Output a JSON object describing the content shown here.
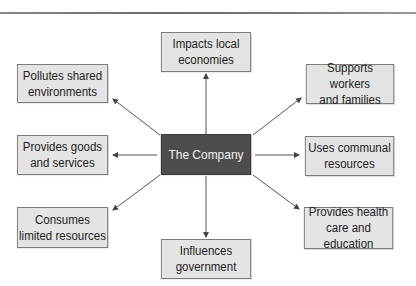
{
  "diagram": {
    "type": "hub-and-spoke",
    "center": {
      "label": "The Company",
      "fill": "#4d4d4d",
      "text_color": "#f2f2f2"
    },
    "node_fill": "#e4e4e4",
    "node_border": "#7a7a7a",
    "edge_color": "#555555",
    "nodes": [
      {
        "id": "top",
        "label": "Impacts local\neconomies"
      },
      {
        "id": "top-left",
        "label": "Pollutes shared\nenvironments"
      },
      {
        "id": "top-right",
        "label": "Supports workers\nand families"
      },
      {
        "id": "left",
        "label": "Provides goods\nand services"
      },
      {
        "id": "right",
        "label": "Uses communal\nresources"
      },
      {
        "id": "bottom-left",
        "label": "Consumes\nlimited resources"
      },
      {
        "id": "bottom-right",
        "label": "Provides health\ncare and education"
      },
      {
        "id": "bottom",
        "label": "Influences\ngovernment"
      }
    ],
    "edges": [
      {
        "from": "center",
        "to": "top",
        "arrow": "end"
      },
      {
        "from": "center",
        "to": "top-left",
        "arrow": "end"
      },
      {
        "from": "center",
        "to": "top-right",
        "arrow": "end"
      },
      {
        "from": "center",
        "to": "left",
        "arrow": "end"
      },
      {
        "from": "center",
        "to": "right",
        "arrow": "end"
      },
      {
        "from": "center",
        "to": "bottom-left",
        "arrow": "end"
      },
      {
        "from": "center",
        "to": "bottom-right",
        "arrow": "end"
      },
      {
        "from": "center",
        "to": "bottom",
        "arrow": "end"
      }
    ]
  }
}
